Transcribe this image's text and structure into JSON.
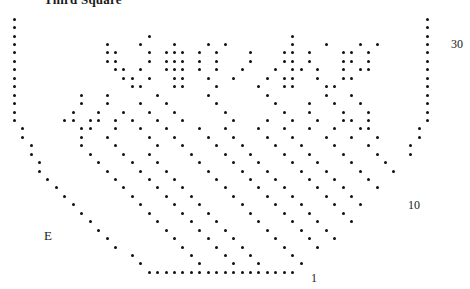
{
  "title": "Third Square",
  "labels": {
    "row30": "30",
    "row10": "10",
    "row1": "1",
    "edge": "E"
  },
  "chart_data": {
    "type": "heatmap",
    "title": "Third Square",
    "xlabel": "",
    "ylabel": "",
    "cols": 50,
    "rows": 31,
    "row_labels": [
      "30",
      "10",
      "1"
    ],
    "legend": [
      {
        "symbol": "dot",
        "meaning": "patterned stitch"
      },
      {
        "symbol": "blank",
        "meaning": "plain stitch"
      }
    ],
    "shape_mask_note": "1 = cell exists in shawl outline, 0 = outside outline",
    "shape_mask": [
      "11111111111111111111111111111111111111111111111111",
      "11111111111111111111111111111111111111111111111111",
      "11111111111111111111111111111111111111111111111111",
      "11111111111111111111111111111111111111111111111111",
      "11111111111111111111111111111111111111111111111111",
      "11111111111111111111111111111111111111111111111111",
      "11111111111111111111111111111111111111111111111111",
      "11111111111111111111111111111111111111111111111111",
      "11111111111111111111111111111111111111111111111111",
      "11111111111111111111111111111111111111111111111111",
      "11111111111111111111111111111111111111111111111111",
      "11111111111111111111111111111111111111111111111111",
      "11111111111111111111111111111111111111111111111111",
      "01111111111111111111111111111111111111111111111110",
      "01111111111111111111111111111111111111111111111110",
      "00111111111111111111111111111111111111111111111100",
      "00111111111111111111111111111111111111111111111100",
      "00011111111111111111111111111111111111111111111000",
      "00011111111111111111111111111111111111111111111000",
      "00001111111111111111111111111111111111111111110000",
      "00000111111111111111111111111111111111111111100000",
      "00000011111111111111111111111111111111111111000000",
      "00000001111111111111111111111111111111111110000000",
      "00000000111111111111111111111111111111111100000000",
      "00000000011111111111111111111111111111111000000000",
      "00000000001111111111111111111111111111110000000000",
      "00000000000111111111111111111111111111100000000000",
      "00000000000011111111111111111111111111000000000000",
      "00000000000000111111111111111111111100000000000000",
      "00000000000000011111111111111111111000000000000000",
      "00000000000000001111111111111111110000000000000000"
    ],
    "dot_mask_note": "1 = dot drawn in cell, 0 = empty cell (only meaningful where shape_mask is 1); rows top-to-bottom = row 31 down to row 1",
    "dot_mask": [
      "10000000000000000000000000000000000000000000000001",
      "10000000000000000000000000000000000000000000000001",
      "10000000000000001000000000000000010000000000000001",
      "10000000000100010001000101000000010001000101000001",
      "10000000000110001011101010001000110100011010000001",
      "10000000000110001011101010001000110100011010000001",
      "10000000000011010011101010010001011010010110000001",
      "10000000000001101001100100100010110010011000000001",
      "10000000000000110001100010000100110001100000000001",
      "10000000100100000100000100000010000001001000000001",
      "10000000100100010010000010000001000100100100000001",
      "10000001001001001001000001000000100100010010000001",
      "10000011011010100100100000100010010010011010000001",
      "01000000110010010010001001000100100100100110000010",
      "01000000100100001001000100100010010001001001000010",
      "00100000100010000100100010010001001000100010000100",
      "00100000010001001000010001001000100100010001000100",
      "00010000001000100100001000100100010010001000100010",
      "00010000000100010010000100010010001001000100010010",
      "00001000000010001001000010001001000100100010001000",
      "00000100000001000100100001000100100010010001000100",
      "00000010000000100010010000100010010001001000100010",
      "00000001000000010001001000010001001000100100010001",
      "00000000100000001000100100001000100100010010001000",
      "00000000010000000100010010000100010010001001000100",
      "00000000001000000010001001000010001001000100100010",
      "00000000000100000001000100100001000100100010001000",
      "00000000000010000000100010010000100010010001000100",
      "00000000000000100000010001001000010001001000100000",
      "00000000000000010000001000100100001000100100010000",
      "00000000000000001111111111111111111111111111000000"
    ]
  }
}
